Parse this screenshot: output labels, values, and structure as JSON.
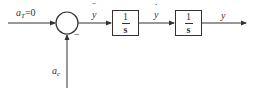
{
  "diagram": {
    "type": "block-diagram",
    "title": "",
    "colors": {
      "stroke": "#333333",
      "background": "#ffffff"
    },
    "inputs": {
      "reference": {
        "base": "a",
        "subscript": "T",
        "value": "=0"
      },
      "disturbance": {
        "base": "a",
        "subscript": "c"
      }
    },
    "summing_junction": {
      "sign_bottom": "−"
    },
    "signals": {
      "after_sum": "y",
      "after_sum_marker": "double-dot",
      "after_block1": "y",
      "after_block1_marker": "single-dot",
      "output": "y"
    },
    "blocks": [
      {
        "id": "integrator-1",
        "numerator": "1",
        "denominator": "s"
      },
      {
        "id": "integrator-2",
        "numerator": "1",
        "denominator": "s"
      }
    ]
  }
}
